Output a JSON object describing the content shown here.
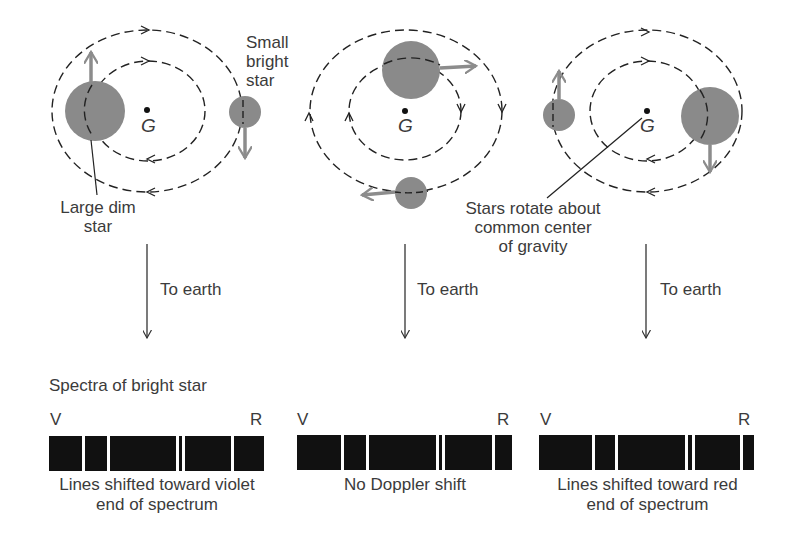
{
  "labels": {
    "small_bright_star": [
      "Small",
      "bright",
      "star"
    ],
    "large_dim_star": [
      "Large dim",
      "star"
    ],
    "common_center": [
      "Stars rotate about",
      "common center",
      "of gravity"
    ],
    "center_symbol": "G",
    "to_earth": "To earth",
    "spectra_title": "Spectra of bright star",
    "violet": "V",
    "red": "R"
  },
  "panels": [
    {
      "caption": [
        "Lines shifted toward violet",
        "end of spectrum"
      ],
      "spectrum": {
        "x": 49,
        "width": 215,
        "gaps": [
          33,
          58,
          127,
          133,
          182
        ]
      }
    },
    {
      "caption": [
        "No Doppler shift"
      ],
      "spectrum": {
        "x": 297,
        "width": 215,
        "gaps": [
          44,
          69,
          139,
          145,
          195
        ]
      }
    },
    {
      "caption": [
        "Lines shifted toward red",
        "end of spectrum"
      ],
      "spectrum": {
        "x": 539,
        "width": 215,
        "gaps": [
          53,
          76,
          146,
          153,
          201
        ]
      }
    }
  ],
  "colors": {
    "star": "#8a8a8a",
    "arrow": "#8c8c8c",
    "orbit": "#222222",
    "spectrum": "#111111"
  }
}
